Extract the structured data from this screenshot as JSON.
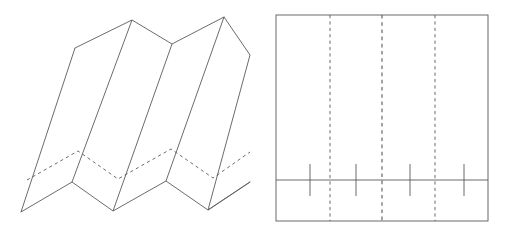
{
  "figure": {
    "name": "accordion-fold-and-net",
    "width": 506,
    "height": 236,
    "background_color": "#ffffff",
    "stroke_color": "#5a5a5a",
    "stroke_width": 0.9,
    "dash_pattern": "3.2 3.2"
  },
  "left_figure": {
    "name": "accordion-folded-sheet-3d",
    "description": "Oblique view of a fan/accordion folded sheet with four panels",
    "panel_count": 4,
    "top_zigzag_points": "75,48 132,20 172,44 224,17",
    "bottom_zigzag_points": "21,212 72,182 113,211 166,181 208,210 250,182",
    "hidden_zigzag_points": "27,180 78,151 118,179 171,149 213,178 250,152",
    "ridge_edges": [
      {
        "name": "edge-left-outer",
        "x1": 75,
        "y1": 48,
        "x2": 21,
        "y2": 212
      },
      {
        "name": "edge-valley-1",
        "x1": 132,
        "y1": 20,
        "x2": 72,
        "y2": 182
      },
      {
        "name": "edge-ridge-1",
        "x1": 172,
        "y1": 44,
        "x2": 113,
        "y2": 211
      },
      {
        "name": "edge-valley-2",
        "x1": 224,
        "y1": 17,
        "x2": 166,
        "y2": 181
      },
      {
        "name": "edge-right-outer",
        "x1": 250,
        "y1": 55,
        "x2": 208,
        "y2": 210
      },
      {
        "name": "edge-far-right",
        "x1": 224,
        "y1": 17,
        "x2": 250,
        "y2": 55
      }
    ],
    "hidden_edges": [
      {
        "name": "hidden-edge-left",
        "x1": 27,
        "y1": 180,
        "x2": 78,
        "y2": 151
      },
      {
        "name": "hidden-edge-mid",
        "x1": 78,
        "y1": 151,
        "x2": 118,
        "y2": 179
      },
      {
        "name": "hidden-edge-right",
        "x1": 118,
        "y1": 179,
        "x2": 171,
        "y2": 149
      },
      {
        "name": "hidden-edge-far",
        "x1": 171,
        "y1": 149,
        "x2": 213,
        "y2": 178
      },
      {
        "name": "hidden-edge-last",
        "x1": 213,
        "y1": 178,
        "x2": 250,
        "y2": 152
      }
    ]
  },
  "right_figure": {
    "name": "flat-net-rectangle",
    "description": "Flat unfolded rectangle with three dashed fold lines and four tick marks on a horizontal line",
    "rect": {
      "x": 276,
      "y": 15,
      "width": 212,
      "height": 206
    },
    "fold_lines": [
      {
        "name": "fold-line-1",
        "x": 330
      },
      {
        "name": "fold-line-2",
        "x": 382
      },
      {
        "name": "fold-line-3",
        "x": 435
      }
    ],
    "horizontal_line": {
      "name": "horizontal-crease",
      "y": 180,
      "x1": 276,
      "x2": 488
    },
    "tick_marks": [
      {
        "name": "tick-mark-1",
        "x": 310,
        "y1": 164,
        "y2": 196
      },
      {
        "name": "tick-mark-2",
        "x": 356,
        "y1": 164,
        "y2": 196
      },
      {
        "name": "tick-mark-3",
        "x": 410,
        "y1": 164,
        "y2": 196
      },
      {
        "name": "tick-mark-4",
        "x": 464,
        "y1": 164,
        "y2": 196
      }
    ]
  }
}
